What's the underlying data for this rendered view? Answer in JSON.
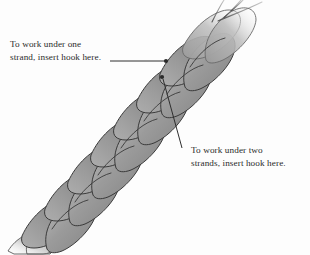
{
  "diagram": {
    "background_color": "#fdfdfd",
    "strand_fill_light": "#b4b4b4",
    "strand_fill_mid": "#969696",
    "strand_fill_dark": "#818181",
    "outline_color": "#3a3a3a",
    "text_color": "#2b2b2b",
    "leader_color": "#2e2e2e"
  },
  "callouts": [
    {
      "id": "under-one-strand",
      "line1": "To work under one",
      "line2": "strand, insert hook here.",
      "leader": "horizontal-right-to-marker",
      "marker_label": "insertion-point-one-strand"
    },
    {
      "id": "under-two-strands",
      "line1": "To work under two",
      "line2": "strands, insert hook here.",
      "leader": "diagonal-up-left-to-marker",
      "marker_label": "insertion-point-two-strands"
    }
  ]
}
